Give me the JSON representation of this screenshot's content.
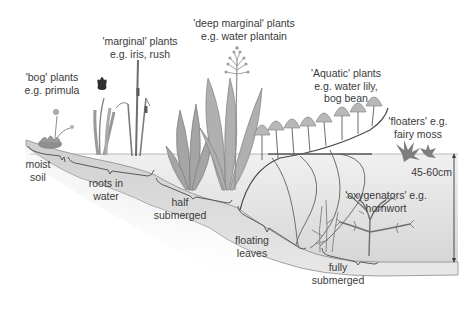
{
  "diagram": {
    "type": "pond planting zones cross-section",
    "colors": {
      "plant": "#9a9a9a",
      "plant_dark": "#6e6e6e",
      "water": "#e4e4e4",
      "bank": "#c8c8c8",
      "outline": "#5a5a5a",
      "text": "#3a3a3a"
    },
    "plant_labels": [
      {
        "id": "bog",
        "line1": "'bog' plants",
        "line2": "e.g. primula"
      },
      {
        "id": "marginal",
        "line1": "'marginal' plants",
        "line2": "e.g. iris, rush"
      },
      {
        "id": "deep-marginal",
        "line1": "'deep marginal' plants",
        "line2": "e.g. water plantain"
      },
      {
        "id": "aquatic",
        "line1": "'Aquatic' plants",
        "line2": "e.g. water lily,",
        "line3": "bog bean"
      },
      {
        "id": "floaters",
        "line1": "'floaters' e.g.",
        "line2": "fairy moss"
      },
      {
        "id": "oxygenators",
        "line1": "'oxygenators' e.g.",
        "line2": "hornwort"
      }
    ],
    "zone_labels": [
      {
        "id": "moist-soil",
        "line1": "moist",
        "line2": "soil"
      },
      {
        "id": "roots-in-water",
        "line1": "roots in",
        "line2": "water"
      },
      {
        "id": "half-submerged",
        "line1": "half",
        "line2": "submerged"
      },
      {
        "id": "floating-leaves",
        "line1": "floating",
        "line2": "leaves"
      },
      {
        "id": "fully-submerged",
        "line1": "fully",
        "line2": "submerged"
      }
    ],
    "depth": {
      "label": "45-60cm"
    }
  }
}
